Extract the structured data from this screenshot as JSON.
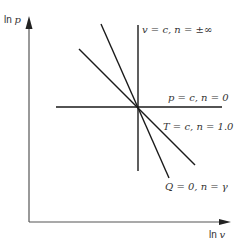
{
  "diagram": {
    "axes": {
      "y_label_prefix": "ln",
      "y_label_var": "p",
      "x_label_prefix": "ln",
      "x_label_var": "v"
    },
    "processes": [
      {
        "name": "isochoric",
        "label_left": "v = c,",
        "label_right": "n = ±∞"
      },
      {
        "name": "isobaric",
        "label_left": "p = c,",
        "label_right": "n = 0"
      },
      {
        "name": "isothermal",
        "label_left": "T = c,",
        "label_right": "n = 1.0"
      },
      {
        "name": "adiabatic",
        "label_left": "Q = 0,",
        "label_right": "n = γ"
      }
    ],
    "colors": {
      "line": "#1a1a1a",
      "axis": "#555555",
      "text": "#333333"
    }
  }
}
